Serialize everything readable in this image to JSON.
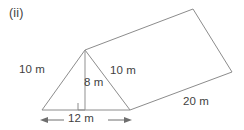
{
  "figure": {
    "part_label": "(ii)",
    "shape_name": "triangular-prism",
    "stroke_color": "#8c8c8c",
    "text_color": "#3f3f3f",
    "background_color": "#ffffff"
  },
  "dimensions": {
    "slant_left": "10 m",
    "height": "8 m",
    "slant_right": "10 m",
    "base": "12 m",
    "length": "20 m"
  },
  "markers": {
    "right_angle": "right-angle-marker",
    "base_arrow": "double-headed-arrow"
  }
}
